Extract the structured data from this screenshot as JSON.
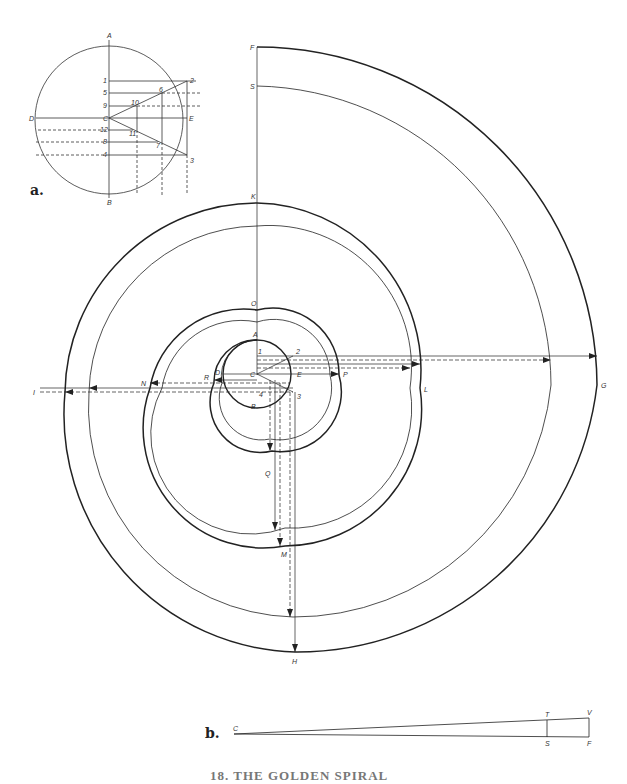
{
  "figure_a": {
    "tag": "a.",
    "center": [
      110,
      119
    ],
    "radius": 74,
    "points": {
      "A": "A",
      "B": "B",
      "C": "C",
      "D": "D",
      "E": "E",
      "n1": "1",
      "n2": "2",
      "n3": "3",
      "n4": "4",
      "n5": "5",
      "n6": "6",
      "n7": "7",
      "n8": "8",
      "n9": "9",
      "n10": "10",
      "n11": "11",
      "n12": "12"
    }
  },
  "figure_main": {
    "labels": {
      "A": "A",
      "B": "B",
      "C": "C",
      "D": "D",
      "E": "E",
      "n1": "1",
      "n2": "2",
      "n3": "3",
      "n4": "4",
      "F": "F",
      "S": "S",
      "K": "K",
      "O": "O",
      "G": "G",
      "L": "L",
      "P": "P",
      "H": "H",
      "M": "M",
      "Q": "Q",
      "I": "I",
      "N": "N",
      "R": "R"
    }
  },
  "figure_b": {
    "tag": "b.",
    "labels": {
      "C": "C",
      "T": "T",
      "V": "V",
      "S": "S",
      "F": "F"
    }
  },
  "caption": "18. THE GOLDEN SPIRAL"
}
